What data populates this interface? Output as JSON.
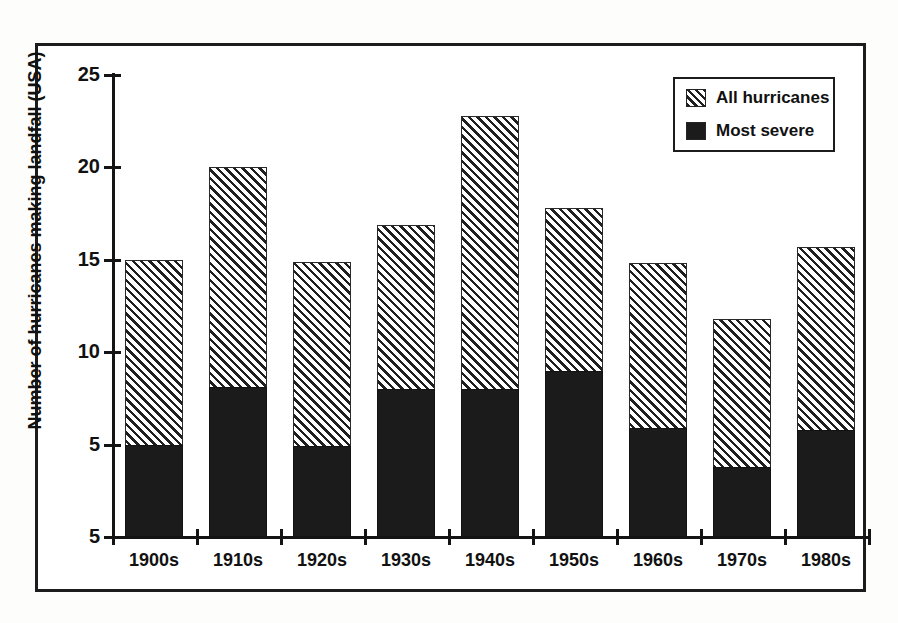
{
  "chart_data": {
    "type": "bar",
    "title": "",
    "xlabel": "",
    "ylabel": "Number of hurricanes making landfall (USA)",
    "stacked": true,
    "grid": false,
    "legend_position": "top-right",
    "categories": [
      "1900s",
      "1910s",
      "1920s",
      "1930s",
      "1940s",
      "1950s",
      "1960s",
      "1970s",
      "1980s"
    ],
    "ylim": [
      0,
      25
    ],
    "yticks": [
      0,
      5,
      10,
      15,
      20,
      25
    ],
    "ytick_labels": [
      "5",
      "5",
      "10",
      "15",
      "20",
      "25"
    ],
    "series": [
      {
        "name": "All hurricanes",
        "fill": "diagonal-hatch",
        "values": [
          15.0,
          20.0,
          14.9,
          16.9,
          22.8,
          17.8,
          14.8,
          11.8,
          15.7
        ]
      },
      {
        "name": "Most severe",
        "fill": "solid-black",
        "values": [
          5.0,
          8.1,
          4.9,
          8.0,
          8.0,
          9.0,
          5.9,
          3.8,
          5.8
        ]
      }
    ]
  },
  "legend": {
    "items": [
      {
        "label": "All hurricanes",
        "swatch": "hatched-swatch"
      },
      {
        "label": "Most severe",
        "swatch": "solid-swatch"
      }
    ]
  },
  "colors": {
    "axis": "#141414",
    "frame": "#1c1c1c",
    "severe": "#1b1b1b",
    "hatch_line": "#1f1f1f",
    "background": "#ffffff"
  }
}
